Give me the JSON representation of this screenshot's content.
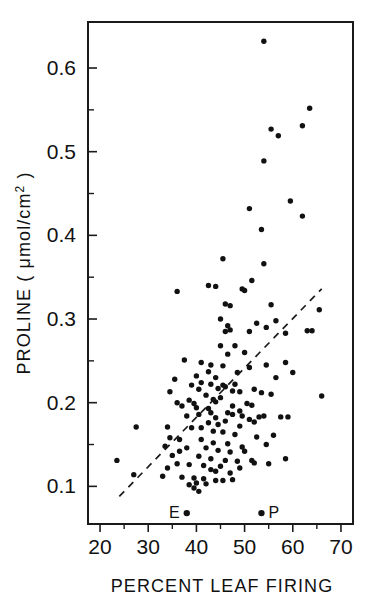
{
  "figure": {
    "background_color": "#ffffff",
    "ink_color": "#111111"
  },
  "axes": {
    "x_title": "PERCENT LEAF FIRING",
    "y_title_main": "PROLINE (",
    "y_title_units": "μmol/cm",
    "y_title_exponent": "2",
    "y_title_close": ")"
  },
  "chart_data": {
    "type": "scatter",
    "title": "",
    "xlabel": "PERCENT LEAF FIRING",
    "ylabel": "PROLINE ( μmol/cm2 )",
    "xlim": [
      17.5,
      72.5
    ],
    "ylim": [
      0.055,
      0.655
    ],
    "grid": false,
    "legend": "none",
    "xticks": [
      20,
      30,
      40,
      50,
      60,
      70
    ],
    "xtick_labels": [
      "20",
      "30",
      "40",
      "50",
      "60",
      "70"
    ],
    "xticks_minor": [
      25,
      35,
      45,
      55,
      65
    ],
    "yticks": [
      0.1,
      0.2,
      0.3,
      0.4,
      0.5,
      0.6
    ],
    "ytick_labels": [
      "0.1",
      "0.2",
      "0.3",
      "0.4",
      "0.5",
      "0.6"
    ],
    "yticks_minor": [
      0.15,
      0.25,
      0.35,
      0.45,
      0.55
    ],
    "series": [
      {
        "name": "proline vs leaf firing",
        "marker": "filled-circle",
        "color": "#111111",
        "points": [
          [
            54.0,
            0.632
          ],
          [
            63.5,
            0.552
          ],
          [
            55.5,
            0.527
          ],
          [
            62.0,
            0.531
          ],
          [
            57.0,
            0.519
          ],
          [
            54.0,
            0.489
          ],
          [
            59.5,
            0.441
          ],
          [
            62.0,
            0.423
          ],
          [
            51.0,
            0.432
          ],
          [
            53.5,
            0.407
          ],
          [
            45.5,
            0.372
          ],
          [
            54.0,
            0.366
          ],
          [
            51.5,
            0.346
          ],
          [
            42.5,
            0.34
          ],
          [
            44.0,
            0.339
          ],
          [
            49.5,
            0.336
          ],
          [
            36.0,
            0.333
          ],
          [
            50.0,
            0.334
          ],
          [
            65.5,
            0.311
          ],
          [
            55.5,
            0.317
          ],
          [
            46.0,
            0.318
          ],
          [
            47.0,
            0.316
          ],
          [
            56.5,
            0.298
          ],
          [
            52.5,
            0.295
          ],
          [
            46.5,
            0.292
          ],
          [
            47.0,
            0.287
          ],
          [
            46.0,
            0.285
          ],
          [
            63.0,
            0.286
          ],
          [
            64.0,
            0.286
          ],
          [
            54.5,
            0.29
          ],
          [
            58.5,
            0.283
          ],
          [
            46.5,
            0.258
          ],
          [
            37.5,
            0.251
          ],
          [
            41.0,
            0.248
          ],
          [
            43.0,
            0.245
          ],
          [
            58.5,
            0.248
          ],
          [
            51.0,
            0.242
          ],
          [
            42.5,
            0.237
          ],
          [
            45.5,
            0.244
          ],
          [
            60.0,
            0.236
          ],
          [
            40.0,
            0.232
          ],
          [
            44.0,
            0.23
          ],
          [
            56.5,
            0.23
          ],
          [
            35.5,
            0.228
          ],
          [
            41.0,
            0.224
          ],
          [
            43.0,
            0.222
          ],
          [
            45.5,
            0.221
          ],
          [
            46.0,
            0.219
          ],
          [
            48.0,
            0.222
          ],
          [
            52.0,
            0.216
          ],
          [
            34.5,
            0.213
          ],
          [
            40.5,
            0.216
          ],
          [
            44.5,
            0.217
          ],
          [
            47.5,
            0.214
          ],
          [
            49.0,
            0.213
          ],
          [
            42.0,
            0.209
          ],
          [
            66.0,
            0.208
          ],
          [
            36.0,
            0.2
          ],
          [
            38.5,
            0.203
          ],
          [
            39.5,
            0.199
          ],
          [
            44.0,
            0.201
          ],
          [
            47.5,
            0.196
          ],
          [
            40.0,
            0.194
          ],
          [
            42.5,
            0.193
          ],
          [
            46.5,
            0.188
          ],
          [
            47.5,
            0.186
          ],
          [
            49.5,
            0.184
          ],
          [
            51.0,
            0.18
          ],
          [
            53.0,
            0.183
          ],
          [
            54.0,
            0.184
          ],
          [
            57.5,
            0.183
          ],
          [
            59.0,
            0.183
          ],
          [
            38.0,
            0.184
          ],
          [
            40.5,
            0.186
          ],
          [
            44.0,
            0.182
          ],
          [
            46.0,
            0.178
          ],
          [
            52.0,
            0.177
          ],
          [
            34.0,
            0.171
          ],
          [
            27.5,
            0.171
          ],
          [
            39.0,
            0.17
          ],
          [
            43.5,
            0.166
          ],
          [
            45.5,
            0.165
          ],
          [
            48.0,
            0.162
          ],
          [
            56.0,
            0.161
          ],
          [
            34.5,
            0.158
          ],
          [
            36.5,
            0.156
          ],
          [
            41.0,
            0.156
          ],
          [
            43.5,
            0.152
          ],
          [
            54.5,
            0.15
          ],
          [
            33.5,
            0.148
          ],
          [
            38.0,
            0.146
          ],
          [
            42.0,
            0.146
          ],
          [
            44.5,
            0.143
          ],
          [
            47.0,
            0.141
          ],
          [
            50.0,
            0.142
          ],
          [
            35.0,
            0.137
          ],
          [
            40.5,
            0.136
          ],
          [
            43.0,
            0.133
          ],
          [
            46.0,
            0.131
          ],
          [
            48.5,
            0.13
          ],
          [
            51.5,
            0.131
          ],
          [
            58.5,
            0.133
          ],
          [
            23.5,
            0.131
          ],
          [
            36.0,
            0.127
          ],
          [
            38.5,
            0.126
          ],
          [
            41.5,
            0.125
          ],
          [
            45.0,
            0.124
          ],
          [
            49.0,
            0.122
          ],
          [
            34.0,
            0.122
          ],
          [
            27.0,
            0.114
          ],
          [
            33.0,
            0.112
          ],
          [
            37.0,
            0.111
          ],
          [
            39.5,
            0.11
          ],
          [
            41.5,
            0.109
          ],
          [
            44.0,
            0.107
          ],
          [
            45.5,
            0.107
          ],
          [
            47.5,
            0.108
          ],
          [
            40.0,
            0.104
          ],
          [
            42.0,
            0.103
          ],
          [
            38.5,
            0.102
          ],
          [
            39.5,
            0.098
          ],
          [
            40.5,
            0.094
          ],
          [
            44.5,
            0.174
          ],
          [
            42.5,
            0.176
          ],
          [
            50.5,
            0.199
          ],
          [
            48.5,
            0.236
          ],
          [
            45.0,
            0.206
          ],
          [
            43.5,
            0.204
          ],
          [
            39.0,
            0.221
          ],
          [
            37.0,
            0.196
          ],
          [
            50.0,
            0.26
          ],
          [
            48.0,
            0.268
          ],
          [
            45.0,
            0.268
          ],
          [
            53.5,
            0.212
          ],
          [
            55.5,
            0.21
          ],
          [
            51.5,
            0.197
          ],
          [
            49.0,
            0.172
          ],
          [
            52.5,
            0.159
          ],
          [
            43.0,
            0.188
          ],
          [
            41.0,
            0.17
          ],
          [
            46.5,
            0.151
          ],
          [
            49.5,
            0.147
          ],
          [
            36.5,
            0.142
          ],
          [
            44.0,
            0.118
          ],
          [
            47.0,
            0.116
          ],
          [
            52.0,
            0.128
          ],
          [
            55.0,
            0.127
          ],
          [
            43.0,
            0.12
          ],
          [
            49.0,
            0.19
          ],
          [
            54.5,
            0.245
          ],
          [
            51.0,
            0.285
          ],
          [
            45.0,
            0.3
          ]
        ]
      }
    ],
    "fit_line": {
      "type": "dashed",
      "label": "",
      "x_start": 24.0,
      "y_start": 0.088,
      "x_end": 66.0,
      "y_end": 0.336
    },
    "annotations": [
      {
        "label": "E",
        "x": 38.0,
        "y": 0.068,
        "label_side": "left"
      },
      {
        "label": "P",
        "x": 53.5,
        "y": 0.068,
        "label_side": "right"
      }
    ]
  }
}
